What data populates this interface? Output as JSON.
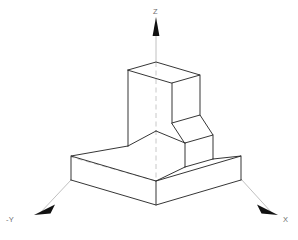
{
  "drawing": {
    "title": "Isometric view of L-shaped stepped block",
    "projection": "isometric",
    "background_color": "#ffffff",
    "edge_color": "#2b2b2b",
    "axis_color": "#b9b9b9",
    "label_color": "#6d6d6d",
    "arrow_color": "#111111"
  },
  "axes": {
    "origin": {
      "x": 156,
      "y": 179
    },
    "items": [
      {
        "name": "z-axis",
        "label": "Z",
        "direction": "up",
        "label_x": 153,
        "label_y": 14,
        "line_x1": 156,
        "line_y1": 179,
        "line_x2": 156,
        "line_y2": 24,
        "arrow_points": "156,17 152.6,36 159.4,36",
        "style": "dashed-through-solid"
      },
      {
        "name": "x-axis",
        "label": "X",
        "direction": "down-right",
        "label_x": 283,
        "label_y": 222,
        "line_x1": 156,
        "line_y1": 179,
        "line_x2": 272,
        "line_y2": 213,
        "arrow_points": "278,215 258,205 261.5,213.8",
        "style": "solid"
      },
      {
        "name": "negative-y-axis",
        "label": "-Y",
        "direction": "down-left",
        "label_x": 8,
        "label_y": 222,
        "line_x1": 156,
        "line_y1": 179,
        "line_x2": 40,
        "line_y2": 213,
        "arrow_points": "34,215 54,205 50.5,213.8",
        "style": "solid"
      }
    ]
  },
  "solid": {
    "name": "l-shaped-stepped-block",
    "description": "L-shaped block: tall vertical wall rising at rear-left on a flat rectangular base with a lower step at the right",
    "vertices": {
      "base_top_back": {
        "x": 156,
        "y": 131
      },
      "base_top_left": {
        "x": 71,
        "y": 156
      },
      "base_top_front": {
        "x": 156,
        "y": 181
      },
      "base_top_right": {
        "x": 241,
        "y": 156
      },
      "base_bot_left": {
        "x": 71,
        "y": 180
      },
      "base_bot_front": {
        "x": 156,
        "y": 205
      },
      "base_bot_right": {
        "x": 241,
        "y": 180
      },
      "wall_top_back": {
        "x": 156,
        "y": 62
      },
      "wall_top_left": {
        "x": 128,
        "y": 70
      },
      "wall_top_front": {
        "x": 172,
        "y": 83
      },
      "wall_top_right": {
        "x": 200,
        "y": 75
      },
      "wall_bot_left": {
        "x": 128,
        "y": 146
      },
      "wall_front_low": {
        "x": 172,
        "y": 123
      },
      "wall_right_low": {
        "x": 200,
        "y": 115
      },
      "step_top_front": {
        "x": 185,
        "y": 143
      },
      "step_top_right": {
        "x": 213,
        "y": 135
      },
      "step_bot_right": {
        "x": 213,
        "y": 159
      }
    },
    "hidden_lines": [
      {
        "name": "center-line-z",
        "x1": 156,
        "y1": 62,
        "x2": 156,
        "y2": 181
      },
      {
        "name": "hidden-edge-y",
        "x1": 156,
        "y1": 181,
        "x2": 71,
        "y2": 156
      }
    ]
  }
}
